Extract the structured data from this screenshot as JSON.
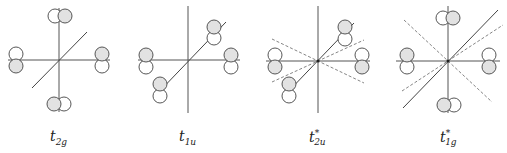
{
  "figure": {
    "panels": [
      {
        "id": "t2g",
        "label_base": "t",
        "label_sub": "2g",
        "label_sup": "",
        "center": [
          59,
          60
        ]
      },
      {
        "id": "t1u",
        "label_base": "t",
        "label_sub": "1u",
        "label_sup": "",
        "center": [
          188,
          60
        ]
      },
      {
        "id": "t2u_star",
        "label_base": "t",
        "label_sub": "2u",
        "label_sup": "*",
        "center": [
          318,
          61
        ]
      },
      {
        "id": "t1g_star",
        "label_base": "t",
        "label_sub": "1g",
        "label_sup": "*",
        "center": [
          448,
          61
        ]
      }
    ],
    "colors": {
      "lobe_shaded": "#e2e2e2",
      "lobe_unshaded": "#ffffff",
      "line": "#444444"
    }
  }
}
